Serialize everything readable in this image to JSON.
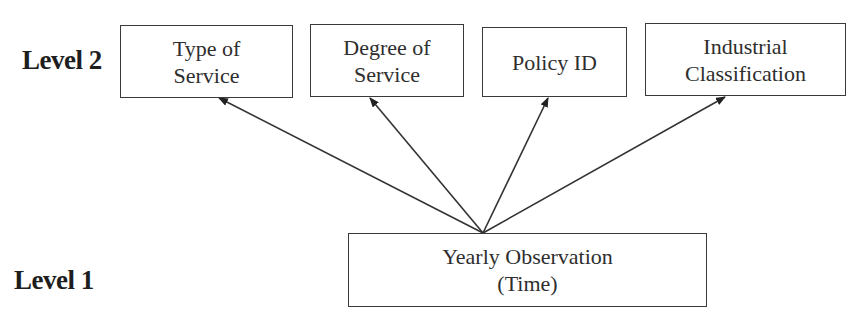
{
  "levels": {
    "level2": "Level 2",
    "level1": "Level 1"
  },
  "level2_nodes": [
    {
      "line1": "Type of",
      "line2": "Service"
    },
    {
      "line1": "Degree of",
      "line2": "Service"
    },
    {
      "line1": "Policy ID",
      "line2": ""
    },
    {
      "line1": "Industrial",
      "line2": "Classification"
    }
  ],
  "level1_node": {
    "line1": "Yearly Observation",
    "line2": "(Time)"
  },
  "edges": [
    {
      "from": "Yearly Observation (Time)",
      "to": "Type of Service"
    },
    {
      "from": "Yearly Observation (Time)",
      "to": "Degree of Service"
    },
    {
      "from": "Yearly Observation (Time)",
      "to": "Policy ID"
    },
    {
      "from": "Yearly Observation (Time)",
      "to": "Industrial Classification"
    }
  ]
}
